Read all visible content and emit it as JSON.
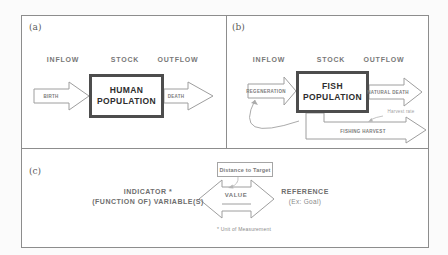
{
  "figure": {
    "panel_a": {
      "label": "(a)",
      "inflow_header": "INFLOW",
      "stock_header": "STOCK",
      "outflow_header": "OUTFLOW",
      "inflow_arrow_label": "BIRTH",
      "stock_box_label": "HUMAN\nPOPULATION",
      "outflow_arrow_label": "DEATH"
    },
    "panel_b": {
      "label": "(b)",
      "inflow_header": "INFLOW",
      "stock_header": "STOCK",
      "outflow_header": "OUTFLOW",
      "inflow_arrow_label": "REGENERATION",
      "stock_box_label": "FISH\nPOPULATION",
      "outflow_arrow_label": "NATURAL DEATH",
      "harvest_arrow_label": "FISHING HARVEST",
      "harvest_rate_label": "Harvest rate"
    },
    "panel_c": {
      "label": "(c)",
      "distance_box_label": "Distance to Target",
      "indicator_line1": "INDICATOR *",
      "indicator_line2": "(FUNCTION OF) VARIABLE(S)",
      "value_label": "VALUE",
      "reference_line1": "REFERENCE",
      "reference_line2": "(Ex: Goal)",
      "footnote": "* Unit of Measurement"
    },
    "colors": {
      "frame_border": "#8d8d8d",
      "stock_box_border": "#4d4d4d",
      "arrow_outline": "#9e9e9e",
      "stock_text": "#2e2e2e",
      "label_text": "#777777",
      "muted_text": "#9f9f9f"
    }
  }
}
